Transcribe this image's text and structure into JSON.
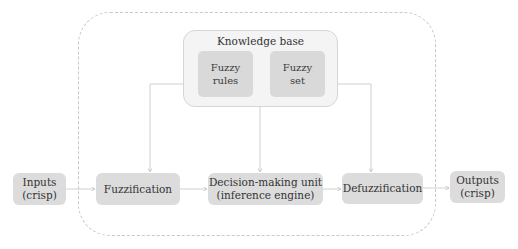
{
  "diagram": {
    "container": {
      "style": "dashed-rounded"
    },
    "knowledge_base": {
      "title": "Knowledge base",
      "items": [
        {
          "label": "Fuzzy\nrules"
        },
        {
          "label": "Fuzzy\nset"
        }
      ]
    },
    "nodes": [
      {
        "id": "inputs",
        "label": "Inputs\n(crisp)"
      },
      {
        "id": "fuzzification",
        "label": "Fuzzification"
      },
      {
        "id": "decision",
        "label": "Decision-making unit\n(inference engine)"
      },
      {
        "id": "defuzzification",
        "label": "Defuzzification"
      },
      {
        "id": "outputs",
        "label": "Outputs\n(crisp)"
      }
    ],
    "edges": [
      {
        "from": "inputs",
        "to": "fuzzification"
      },
      {
        "from": "fuzzification",
        "to": "decision"
      },
      {
        "from": "decision",
        "to": "defuzzification"
      },
      {
        "from": "defuzzification",
        "to": "outputs"
      },
      {
        "from": "knowledge_base",
        "to": "fuzzification"
      },
      {
        "from": "knowledge_base",
        "to": "decision"
      },
      {
        "from": "knowledge_base",
        "to": "defuzzification"
      }
    ],
    "colors": {
      "node_fill": "#dcdcdc",
      "kb_fill": "#f4f4f4",
      "line": "#c4c4c4",
      "dashed_border": "#c8c8c8"
    }
  }
}
